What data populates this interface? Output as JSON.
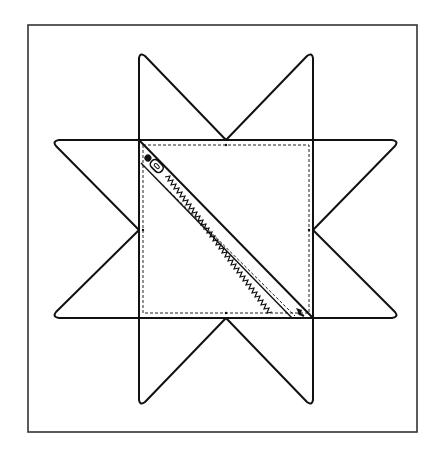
{
  "diagram": {
    "title": "",
    "colors": {
      "background": "#ffffff",
      "line": "#111111",
      "frame": "#333333"
    },
    "frame": {
      "x": 28,
      "y": 25,
      "width": 389,
      "height": 407
    },
    "center_square": {
      "x1": 139,
      "y1": 140,
      "x2": 313,
      "y2": 318
    },
    "stitch_square": {
      "x1": 143,
      "y1": 145,
      "x2": 309,
      "y2": 313
    },
    "star_points": {
      "top": [
        [
          139,
          53
        ],
        [
          226,
          140
        ],
        [
          313,
          53
        ]
      ],
      "bottom": [
        [
          139,
          405
        ],
        [
          226,
          318
        ],
        [
          313,
          405
        ]
      ],
      "left": [
        [
          53,
          140
        ],
        [
          139,
          230
        ],
        [
          53,
          318
        ]
      ],
      "right": [
        [
          398,
          140
        ],
        [
          313,
          230
        ],
        [
          398,
          318
        ]
      ]
    },
    "zipper": {
      "start": [
        144,
        158
      ],
      "end": [
        306,
        318
      ],
      "pull_tab": "zipper-pull"
    }
  }
}
